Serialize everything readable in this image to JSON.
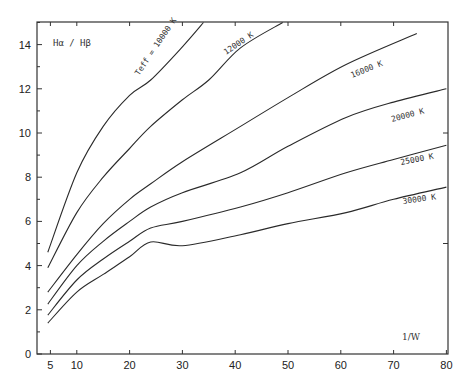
{
  "chart_data": {
    "type": "line",
    "title": "",
    "xlabel": "1/W",
    "ylabel": "Hα / Hβ",
    "xlim": [
      2.5,
      80
    ],
    "ylim": [
      0,
      15
    ],
    "grid": false,
    "legend_position": "inline labels on curves",
    "x_ticks": [
      5,
      10,
      20,
      30,
      40,
      50,
      60,
      70,
      80
    ],
    "y_ticks": [
      0,
      2,
      4,
      6,
      8,
      10,
      12,
      14
    ],
    "series": [
      {
        "name": "T_eff = 10000 K",
        "label": "Teff = 10000 K",
        "x": [
          4.5,
          10,
          15,
          20,
          24,
          30,
          34
        ],
        "y": [
          4.6,
          8.2,
          10.3,
          11.7,
          12.4,
          13.9,
          15.0
        ]
      },
      {
        "name": "12000 K",
        "label": "12000 K",
        "x": [
          4.5,
          10,
          15,
          20,
          24,
          30,
          35,
          41,
          49
        ],
        "y": [
          3.9,
          6.4,
          8.0,
          9.3,
          10.3,
          11.5,
          12.4,
          13.85,
          15.0
        ]
      },
      {
        "name": "16000 K",
        "label": "16000 K",
        "x": [
          4.5,
          10,
          15,
          20,
          24,
          30,
          41,
          50,
          61,
          74.4
        ],
        "y": [
          2.8,
          4.5,
          5.9,
          7.0,
          7.7,
          8.7,
          10.3,
          11.6,
          13.1,
          14.5
        ]
      },
      {
        "name": "20000 K",
        "label": "20000 K",
        "x": [
          4.5,
          10,
          15,
          20,
          24,
          30,
          41,
          50,
          61,
          70,
          80
        ],
        "y": [
          2.26,
          4.0,
          5.1,
          6.0,
          6.65,
          7.3,
          8.2,
          9.4,
          10.7,
          11.4,
          12.0
        ]
      },
      {
        "name": "25000 K",
        "label": "25000 K",
        "x": [
          4.5,
          10,
          15,
          20,
          24,
          30,
          41,
          50,
          61,
          70,
          80
        ],
        "y": [
          1.76,
          3.35,
          4.3,
          5.1,
          5.7,
          6.0,
          6.65,
          7.3,
          8.2,
          8.8,
          9.45
        ]
      },
      {
        "name": "30000 K",
        "label": "30000 K",
        "x": [
          4.5,
          10,
          15,
          20,
          24,
          30,
          41,
          50,
          61,
          70,
          80
        ],
        "y": [
          1.4,
          2.8,
          3.6,
          4.4,
          5.07,
          4.9,
          5.4,
          5.9,
          6.4,
          7.0,
          7.55
        ]
      }
    ]
  },
  "labels": {
    "ylabel": "Hα / Hβ",
    "xlabel": "1/W",
    "teff10000": "Teff = 10000 K",
    "k12000": "12000 K",
    "k16000": "16000 K",
    "k20000": "20000 K",
    "k25000": "25000 K",
    "k30000": "30000 K"
  },
  "axis": {
    "x_tick_labels": [
      "5",
      "10",
      "20",
      "30",
      "40",
      "50",
      "60",
      "70",
      "80"
    ],
    "y_tick_labels": [
      "0",
      "2",
      "4",
      "6",
      "8",
      "10",
      "12",
      "14"
    ]
  }
}
